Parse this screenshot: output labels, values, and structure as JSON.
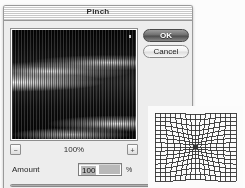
{
  "window": {
    "title": "Pinch"
  },
  "buttons": {
    "ok_label": "OK",
    "cancel_label": "Cancel"
  },
  "preview": {
    "zoom_out_glyph": "−",
    "zoom_in_glyph": "+",
    "zoom_level": "100%"
  },
  "amount": {
    "label": "Amount",
    "value": "100",
    "unit": "%",
    "slider_percent": 100
  },
  "grid_preview": {
    "distortion_amount": 100
  },
  "colors": {
    "dialog_background": "#ededed",
    "titlebar_text": "#2b2b2b",
    "default_button": "#4e4e4e",
    "field_selection": "#b9b9b9",
    "preview_background": "#000000",
    "grid_line": "#333333"
  }
}
